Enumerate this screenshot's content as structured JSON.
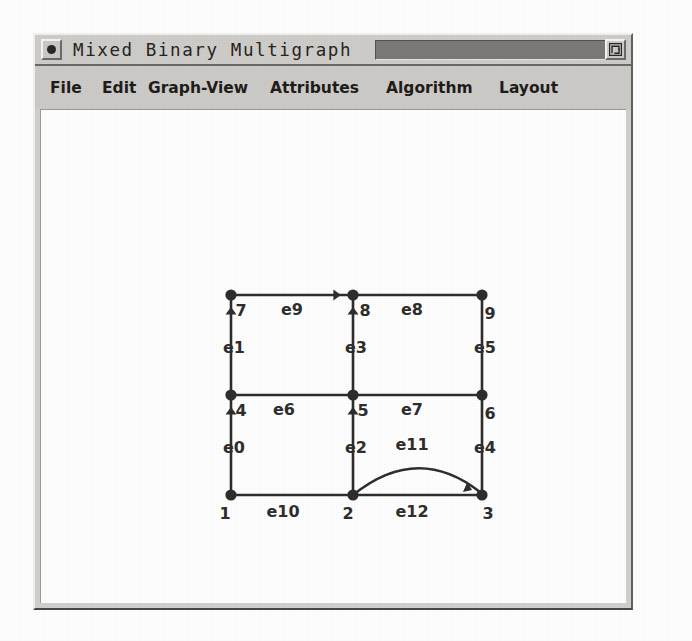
{
  "window": {
    "title": "Mixed Binary Multigraph",
    "menu_button_icon": "window-menu-dot-icon",
    "resize_icon": "resize-corner-icon"
  },
  "menubar": {
    "items": [
      {
        "label": "File",
        "x": 12
      },
      {
        "label": "Edit",
        "x": 64
      },
      {
        "label": "Graph-View",
        "x": 110
      },
      {
        "label": "Attributes",
        "x": 232
      },
      {
        "label": "Algorithm",
        "x": 348
      },
      {
        "label": "Layout",
        "x": 461
      }
    ]
  },
  "graph": {
    "nodes": [
      {
        "id": "1",
        "label": "1",
        "x": 190,
        "y": 385,
        "label_dx": -6,
        "label_dy": 24
      },
      {
        "id": "2",
        "label": "2",
        "x": 312,
        "y": 385,
        "label_dx": -5,
        "label_dy": 24
      },
      {
        "id": "3",
        "label": "3",
        "x": 441,
        "y": 385,
        "label_dx": 6,
        "label_dy": 24
      },
      {
        "id": "4",
        "label": "4",
        "x": 190,
        "y": 285,
        "label_dx": 10,
        "label_dy": 21
      },
      {
        "id": "5",
        "label": "5",
        "x": 312,
        "y": 285,
        "label_dx": 10,
        "label_dy": 21
      },
      {
        "id": "6",
        "label": "6",
        "x": 441,
        "y": 285,
        "label_dx": 8,
        "label_dy": 24
      },
      {
        "id": "7",
        "label": "7",
        "x": 190,
        "y": 185,
        "label_dx": 10,
        "label_dy": 21
      },
      {
        "id": "8",
        "label": "8",
        "x": 312,
        "y": 185,
        "label_dx": 12,
        "label_dy": 21
      },
      {
        "id": "9",
        "label": "9",
        "x": 441,
        "y": 185,
        "label_dx": 8,
        "label_dy": 24
      }
    ],
    "edges": [
      {
        "id": "e0",
        "label": "e0",
        "from": "1",
        "to": "4",
        "directed": true,
        "label_x": 193,
        "label_y": 343
      },
      {
        "id": "e1",
        "label": "e1",
        "from": "4",
        "to": "7",
        "directed": true,
        "label_x": 193,
        "label_y": 243
      },
      {
        "id": "e2",
        "label": "e2",
        "from": "2",
        "to": "5",
        "directed": true,
        "label_x": 315,
        "label_y": 343
      },
      {
        "id": "e3",
        "label": "e3",
        "from": "5",
        "to": "8",
        "directed": true,
        "label_x": 315,
        "label_y": 243
      },
      {
        "id": "e4",
        "label": "e4",
        "from": "3",
        "to": "6",
        "directed": false,
        "label_x": 444,
        "label_y": 343
      },
      {
        "id": "e5",
        "label": "e5",
        "from": "6",
        "to": "9",
        "directed": false,
        "label_x": 444,
        "label_y": 243
      },
      {
        "id": "e6",
        "label": "e6",
        "from": "4",
        "to": "5",
        "directed": false,
        "label_x": 243,
        "label_y": 305
      },
      {
        "id": "e7",
        "label": "e7",
        "from": "5",
        "to": "6",
        "directed": false,
        "label_x": 371,
        "label_y": 305
      },
      {
        "id": "e8",
        "label": "e8",
        "from": "8",
        "to": "9",
        "directed": false,
        "label_x": 371,
        "label_y": 205
      },
      {
        "id": "e9",
        "label": "e9",
        "from": "7",
        "to": "8",
        "directed": true,
        "label_x": 251,
        "label_y": 205
      },
      {
        "id": "e10",
        "label": "e10",
        "from": "1",
        "to": "2",
        "directed": false,
        "label_x": 242,
        "label_y": 407
      },
      {
        "id": "e11",
        "label": "e11",
        "from": "2",
        "to": "3",
        "directed": true,
        "curved": true,
        "label_x": 371,
        "label_y": 340
      },
      {
        "id": "e12",
        "label": "e12",
        "from": "2",
        "to": "3",
        "directed": false,
        "label_x": 371,
        "label_y": 407
      }
    ]
  },
  "colors": {
    "window_face": "#d2d0cc",
    "titlebar": "#cfcdc9",
    "title_fill": "#7c7a78",
    "canvas": "#ffffff",
    "graph_ink": "#302e2c"
  }
}
